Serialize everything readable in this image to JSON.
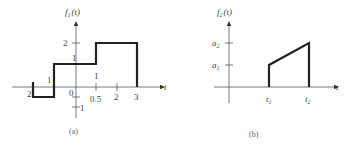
{
  "figure_a": {
    "y_label": "f",
    "y_label_sub": "1",
    "y_label_arg": "(t)",
    "x_label": "t",
    "caption": "(a)",
    "origin_label": "0",
    "x_tick_labels": [
      "2",
      "1",
      "0.5",
      "2",
      "3"
    ],
    "x_tick_labels_above": [
      "1",
      "1"
    ],
    "y_tick_labels": [
      "2",
      "1",
      "1"
    ],
    "signal_description": "Piecewise constant: -1 from t=-2 to -1, 1 from -1 to 1, 2 from 1 to 3, 0 otherwise"
  },
  "figure_b": {
    "y_label": "f",
    "y_label_sub": "2",
    "y_label_arg": "(t)",
    "x_label": "t",
    "caption": "(b)",
    "y_tick_labels": [
      "a",
      "a"
    ],
    "y_tick_subs": [
      "2",
      "1"
    ],
    "x_tick_labels": [
      "t",
      "t"
    ],
    "x_tick_subs": [
      "1",
      "2"
    ],
    "signal_description": "Zero, then jumps to a1 at t1, rises linearly to a2 at t2, then drops to 0"
  }
}
